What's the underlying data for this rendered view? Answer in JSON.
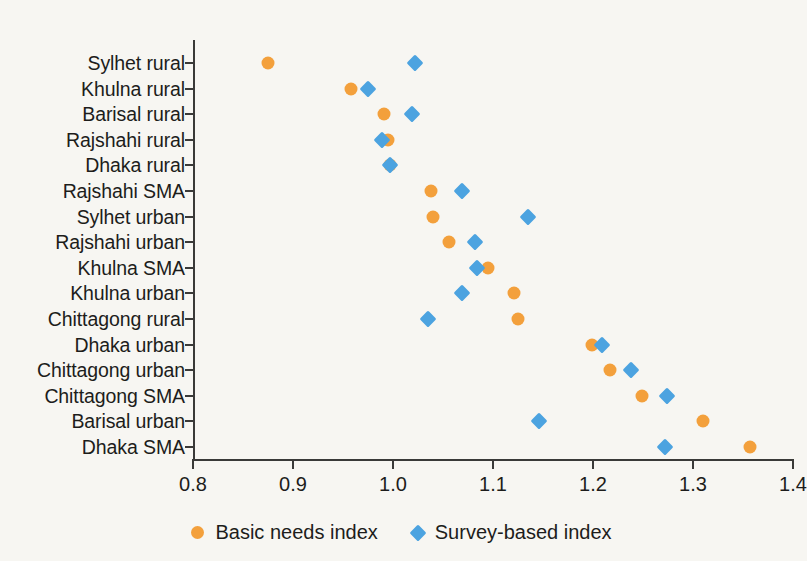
{
  "chart_data": {
    "type": "scatter",
    "title": "",
    "subtitle": "",
    "xlabel": "",
    "ylabel": "",
    "xlim": [
      0.8,
      1.4
    ],
    "xticks": [
      "0.8",
      "0.9",
      "1.0",
      "1.1",
      "1.2",
      "1.3",
      "1.4"
    ],
    "xtick_values": [
      0.8,
      0.9,
      1.0,
      1.1,
      1.2,
      1.3,
      1.4
    ],
    "grid": false,
    "legend_position": "bottom-center",
    "categories": [
      "Sylhet rural",
      "Khulna rural",
      "Barisal rural",
      "Rajshahi rural",
      "Dhaka rural",
      "Rajshahi SMA",
      "Sylhet urban",
      "Rajshahi urban",
      "Khulna SMA",
      "Khulna urban",
      "Chittagong rural",
      "Dhaka urban",
      "Chittagong urban",
      "Chittagong SMA",
      "Barisal urban",
      "Dhaka SMA"
    ],
    "series": [
      {
        "name": "Basic needs index",
        "marker": "circle",
        "color": "#f3a03c",
        "values": [
          0.875,
          0.958,
          0.991,
          0.995,
          0.997,
          1.038,
          1.04,
          1.056,
          1.095,
          1.121,
          1.125,
          1.199,
          1.217,
          1.249,
          1.31,
          1.357
        ]
      },
      {
        "name": "Survey-based index",
        "marker": "diamond",
        "color": "#4ca3e0",
        "values": [
          1.022,
          0.975,
          1.019,
          0.989,
          0.997,
          1.069,
          1.135,
          1.082,
          1.084,
          1.069,
          1.035,
          1.209,
          1.238,
          1.274,
          1.146,
          1.272
        ]
      }
    ]
  },
  "colors": {
    "background": "#f7f6f2",
    "axis": "#3a3a38",
    "text": "#1d1d1b",
    "basic_needs": "#f3a03c",
    "survey_based": "#4ca3e0"
  }
}
